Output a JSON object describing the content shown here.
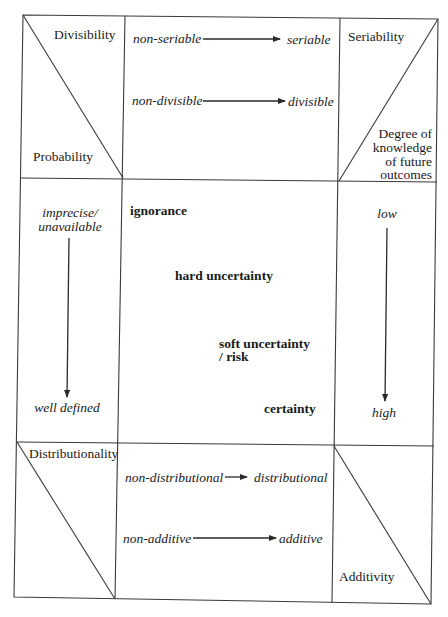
{
  "diagram": {
    "type": "matrix-of-uncertainty",
    "top_left_corner": {
      "upper_label": "Divisibility",
      "lower_label": "Probability"
    },
    "top_middle": {
      "transitions": [
        {
          "from": "non-seriable",
          "to": "seriable"
        },
        {
          "from": "non-divisible",
          "to": "divisible"
        }
      ]
    },
    "top_right_corner": {
      "upper_label": "Seriability",
      "lower_label_lines": [
        "Degree of",
        "knowledge",
        "of future",
        "outcomes"
      ]
    },
    "middle_left": {
      "top_lines": [
        "imprecise/",
        "unavailable"
      ],
      "bottom": "well defined"
    },
    "middle_center": {
      "states": [
        {
          "label": "ignorance"
        },
        {
          "label": "hard uncertainty"
        },
        {
          "label_lines": [
            "soft uncertainty",
            "/ risk"
          ]
        },
        {
          "label": "certainty"
        }
      ]
    },
    "middle_right": {
      "top": "low",
      "bottom": "high"
    },
    "bottom_left_corner": {
      "upper_label": "Distributionality"
    },
    "bottom_middle": {
      "transitions": [
        {
          "from": "non-distributional",
          "to": "distributional"
        },
        {
          "from": "non-additive",
          "to": "additive"
        }
      ]
    },
    "bottom_right_corner": {
      "lower_label": "Additivity"
    }
  },
  "colors": {
    "line": "#3a3a3a",
    "text": "#1a1a1a",
    "background": "#ffffff"
  }
}
